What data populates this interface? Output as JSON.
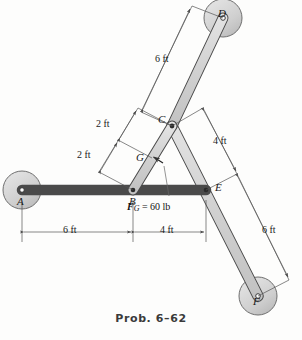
{
  "figure": {
    "caption": "Prob. 6–62",
    "type": "statics-frame-diagram",
    "colors": {
      "member_fill": "#d2d2d2",
      "member_stroke": "#4a4a4a",
      "pad_fill": "#cfcfcf",
      "pad_stroke": "#6a6a6a",
      "dim_line": "#555555",
      "text": "#1a1a1a",
      "caption": "#3a3a3a",
      "background": "#fdfdfc"
    },
    "joints": [
      {
        "id": "A",
        "label": "A",
        "x": 22,
        "y": 190,
        "kind": "pin-support",
        "pad_radius": 19
      },
      {
        "id": "B",
        "label": "B",
        "x": 133,
        "y": 190,
        "kind": "pin-joint",
        "pad_radius": 0
      },
      {
        "id": "C",
        "label": "C",
        "x": 172,
        "y": 126,
        "kind": "pin-joint",
        "pad_radius": 0
      },
      {
        "id": "D",
        "label": "D",
        "x": 223,
        "y": 18,
        "kind": "pin-support",
        "pad_radius": 19
      },
      {
        "id": "E",
        "label": "E",
        "x": 206,
        "y": 190,
        "kind": "pin-joint",
        "pad_radius": 0
      },
      {
        "id": "F",
        "label": "F",
        "x": 258,
        "y": 296,
        "kind": "pin-support",
        "pad_radius": 19
      },
      {
        "id": "G",
        "label": "G",
        "x": 152,
        "y": 158,
        "kind": "load-point",
        "pad_radius": 0
      }
    ],
    "members": [
      {
        "id": "AE",
        "from": "A",
        "to": "E",
        "note": "horizontal bar through B"
      },
      {
        "id": "BC",
        "from": "B",
        "to": "C",
        "note": "short link carrying load at G"
      },
      {
        "id": "CD",
        "from": "C",
        "to": "D",
        "note": "upper inclined bar"
      },
      {
        "id": "CF",
        "from": "C",
        "to": "F",
        "note": "long inclined bar through E"
      }
    ],
    "load": {
      "point": "G",
      "label_bold": "F",
      "label_sub": "G",
      "label_rest": " = 60 lb",
      "label_full": "F_G = 60 lb",
      "magnitude": 60,
      "units": "lb",
      "direction": "perpendicular to member BC, up-left"
    },
    "dimensions": [
      {
        "id": "dim-ab",
        "label": "6 ft",
        "from": "A",
        "to": "B",
        "orientation": "horizontal"
      },
      {
        "id": "dim-be",
        "label": "4 ft",
        "from": "B",
        "to": "E",
        "orientation": "horizontal"
      },
      {
        "id": "dim-bg",
        "label": "2 ft",
        "from": "B",
        "to": "G",
        "orientation": "inclined"
      },
      {
        "id": "dim-gc",
        "label": "2 ft",
        "from": "G",
        "to": "C",
        "orientation": "inclined"
      },
      {
        "id": "dim-cd",
        "label": "6 ft",
        "from": "C",
        "to": "D",
        "orientation": "inclined"
      },
      {
        "id": "dim-ce",
        "label": "4 ft",
        "from": "C",
        "to": "E",
        "orientation": "inclined"
      },
      {
        "id": "dim-ef",
        "label": "6 ft",
        "from": "E",
        "to": "F",
        "orientation": "inclined"
      }
    ],
    "joint_labels": {
      "A": "A",
      "B": "B",
      "C": "C",
      "D": "D",
      "E": "E",
      "F": "F",
      "G": "G"
    },
    "dimension_labels": {
      "ab": "6 ft",
      "be": "4 ft",
      "bg": "2 ft",
      "gc": "2 ft",
      "cd": "6 ft",
      "ce": "4 ft",
      "ef": "6 ft"
    }
  }
}
